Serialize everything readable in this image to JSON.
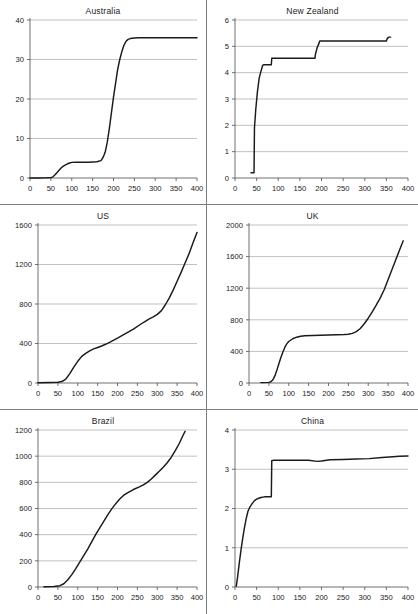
{
  "figure": {
    "layout": "2 columns x 3 rows small-multiples",
    "panel_count": 6
  },
  "chart_data": [
    {
      "type": "line",
      "title": "Australia",
      "xlabel": "",
      "ylabel": "",
      "xlim": [
        0,
        400
      ],
      "ylim": [
        0,
        40
      ],
      "xticks": [
        0,
        50,
        100,
        150,
        200,
        250,
        300,
        350,
        400
      ],
      "yticks": [
        0,
        10,
        20,
        30,
        40
      ],
      "grid": "horizontal",
      "legend": "none",
      "x": [
        0,
        20,
        40,
        50,
        55,
        60,
        65,
        70,
        75,
        80,
        85,
        90,
        95,
        100,
        110,
        120,
        140,
        160,
        170,
        175,
        180,
        185,
        190,
        195,
        200,
        205,
        210,
        215,
        220,
        225,
        230,
        235,
        240,
        250,
        260,
        280,
        300,
        340,
        400
      ],
      "values": [
        0,
        0,
        0.05,
        0.1,
        0.3,
        0.8,
        1.4,
        2.0,
        2.6,
        3.0,
        3.3,
        3.6,
        3.8,
        3.95,
        4.0,
        4.0,
        4.0,
        4.1,
        4.4,
        5.2,
        6.5,
        9.0,
        12.5,
        16.5,
        20.5,
        24.0,
        27.5,
        30.0,
        32.0,
        33.6,
        34.6,
        35.1,
        35.3,
        35.45,
        35.5,
        35.5,
        35.5,
        35.5,
        35.5
      ]
    },
    {
      "type": "line",
      "title": "New Zealand",
      "xlabel": "",
      "ylabel": "",
      "xlim": [
        0,
        400
      ],
      "ylim": [
        0,
        6
      ],
      "xticks": [
        0,
        50,
        100,
        150,
        200,
        250,
        300,
        350,
        400
      ],
      "yticks": [
        0,
        1,
        2,
        3,
        4,
        5,
        6
      ],
      "grid": "horizontal",
      "legend": "none",
      "x": [
        37,
        44,
        45,
        48,
        52,
        56,
        60,
        64,
        66,
        68,
        84,
        85,
        86,
        185,
        186,
        190,
        195,
        196,
        200,
        350,
        352,
        356,
        360
      ],
      "values": [
        0.2,
        0.2,
        1.9,
        2.6,
        3.3,
        3.8,
        4.05,
        4.28,
        4.3,
        4.3,
        4.3,
        4.55,
        4.55,
        4.55,
        4.7,
        4.95,
        5.15,
        5.2,
        5.2,
        5.2,
        5.3,
        5.35,
        5.35
      ]
    },
    {
      "type": "line",
      "title": "US",
      "xlabel": "",
      "ylabel": "",
      "xlim": [
        0,
        400
      ],
      "ylim": [
        0,
        1600
      ],
      "xticks": [
        0,
        50,
        100,
        150,
        200,
        250,
        300,
        350,
        400
      ],
      "yticks": [
        0,
        400,
        800,
        1200,
        1600
      ],
      "grid": "horizontal",
      "legend": "none",
      "x": [
        0,
        30,
        50,
        60,
        70,
        80,
        90,
        100,
        110,
        120,
        130,
        140,
        150,
        160,
        170,
        180,
        200,
        220,
        240,
        260,
        270,
        280,
        290,
        300,
        310,
        320,
        330,
        340,
        350,
        360,
        370,
        380,
        390,
        400
      ],
      "values": [
        2,
        5,
        8,
        15,
        40,
        95,
        160,
        220,
        270,
        300,
        325,
        345,
        360,
        375,
        392,
        412,
        455,
        500,
        545,
        600,
        625,
        650,
        670,
        695,
        730,
        790,
        860,
        940,
        1030,
        1120,
        1215,
        1310,
        1420,
        1525
      ]
    },
    {
      "type": "line",
      "title": "UK",
      "xlabel": "",
      "ylabel": "",
      "xlim": [
        0,
        400
      ],
      "ylim": [
        0,
        2000
      ],
      "xticks": [
        0,
        50,
        100,
        150,
        200,
        250,
        300,
        350,
        400
      ],
      "yticks": [
        0,
        400,
        800,
        1200,
        1600,
        2000
      ],
      "grid": "horizontal",
      "legend": "none",
      "x": [
        30,
        50,
        55,
        60,
        65,
        70,
        75,
        80,
        85,
        90,
        95,
        100,
        110,
        120,
        130,
        140,
        160,
        180,
        200,
        220,
        240,
        250,
        260,
        270,
        280,
        290,
        300,
        310,
        320,
        330,
        340,
        350,
        360,
        370,
        380,
        388
      ],
      "values": [
        5,
        8,
        15,
        40,
        90,
        160,
        240,
        320,
        390,
        450,
        495,
        525,
        560,
        580,
        592,
        598,
        602,
        605,
        608,
        610,
        614,
        618,
        628,
        650,
        690,
        750,
        820,
        900,
        985,
        1075,
        1180,
        1310,
        1440,
        1570,
        1700,
        1800
      ]
    },
    {
      "type": "line",
      "title": "Brazil",
      "xlabel": "",
      "ylabel": "",
      "xlim": [
        0,
        400
      ],
      "ylim": [
        0,
        1200
      ],
      "xticks": [
        0,
        50,
        100,
        150,
        200,
        250,
        300,
        350,
        400
      ],
      "yticks": [
        0,
        200,
        400,
        600,
        800,
        1000,
        1200
      ],
      "grid": "horizontal",
      "legend": "none",
      "x": [
        15,
        40,
        55,
        65,
        75,
        85,
        95,
        105,
        115,
        125,
        135,
        145,
        155,
        165,
        175,
        185,
        195,
        205,
        215,
        225,
        240,
        255,
        265,
        275,
        285,
        295,
        305,
        315,
        325,
        335,
        345,
        355,
        365,
        370
      ],
      "values": [
        2,
        4,
        10,
        25,
        55,
        95,
        140,
        190,
        240,
        290,
        345,
        400,
        450,
        500,
        550,
        595,
        635,
        670,
        700,
        720,
        745,
        765,
        780,
        800,
        825,
        855,
        885,
        915,
        950,
        990,
        1040,
        1095,
        1160,
        1190
      ]
    },
    {
      "type": "line",
      "title": "China",
      "xlabel": "",
      "ylabel": "",
      "xlim": [
        0,
        400
      ],
      "ylim": [
        0,
        4
      ],
      "xticks": [
        0,
        50,
        100,
        150,
        200,
        250,
        300,
        350,
        400
      ],
      "yticks": [
        0,
        1,
        2,
        3,
        4
      ],
      "grid": "horizontal",
      "legend": "none",
      "x": [
        3,
        6,
        10,
        14,
        18,
        22,
        26,
        30,
        35,
        40,
        45,
        50,
        55,
        60,
        65,
        70,
        75,
        80,
        84,
        85,
        90,
        110,
        140,
        170,
        190,
        200,
        220,
        250,
        280,
        310,
        340,
        365,
        380,
        400
      ],
      "values": [
        0.02,
        0.25,
        0.62,
        0.95,
        1.25,
        1.52,
        1.75,
        1.93,
        2.05,
        2.13,
        2.2,
        2.24,
        2.26,
        2.28,
        2.29,
        2.3,
        2.3,
        2.3,
        2.3,
        3.22,
        3.23,
        3.23,
        3.23,
        3.23,
        3.2,
        3.21,
        3.24,
        3.25,
        3.26,
        3.27,
        3.3,
        3.32,
        3.33,
        3.34
      ]
    }
  ],
  "colors": {
    "curve": "#1a1a1a",
    "gridline": "#a6a6a6",
    "axis": "#4d4d4d",
    "divider": "#7d7d7d",
    "background": "#ffffff"
  }
}
